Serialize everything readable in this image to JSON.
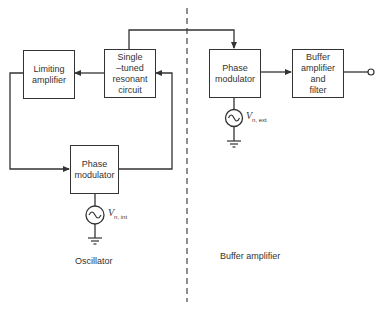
{
  "diagram": {
    "type": "block-diagram",
    "sections": {
      "left": {
        "label": "Oscillator"
      },
      "right": {
        "label": "Buffer amplifier"
      }
    },
    "blocks": {
      "limiting_amplifier": {
        "label_lines": [
          "Limiting",
          "amplifier"
        ]
      },
      "resonant_circuit": {
        "label_lines": [
          "Single",
          "–tuned",
          "resonant",
          "circuit"
        ]
      },
      "phase_modulator_int": {
        "label_lines": [
          "Phase",
          "modulator"
        ]
      },
      "phase_modulator_ext": {
        "label_lines": [
          "Phase",
          "modulator"
        ]
      },
      "buffer_filter": {
        "label_lines": [
          "Buffer",
          "amplifier",
          "and",
          "filter"
        ]
      }
    },
    "sources": {
      "internal": {
        "symbol": "V",
        "subscript": "n, int"
      },
      "external": {
        "symbol": "V",
        "subscript": "n, ext"
      }
    },
    "colors": {
      "line": "#333333",
      "background": "#ffffff"
    }
  }
}
